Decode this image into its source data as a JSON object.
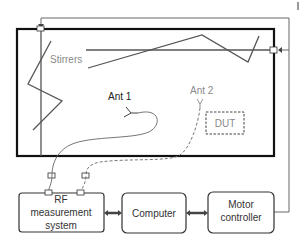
{
  "diagram": {
    "chamber_labels": {
      "stirrers": "Stirrers",
      "ant1": "Ant 1",
      "ant2": "Ant 2",
      "dut": "DUT"
    },
    "blocks": [
      {
        "id": "rf",
        "lines": [
          "RF",
          "measurement",
          "system"
        ]
      },
      {
        "id": "computer",
        "lines": [
          "Computer"
        ]
      },
      {
        "id": "motor",
        "lines": [
          "Motor",
          "controller"
        ]
      }
    ],
    "colors": {
      "chamber_wall": "#111111",
      "stirrer": "#555555",
      "cable": "#666666",
      "ant2_label": "#8a8a8a",
      "stirrer_label": "#9a9a9a",
      "dut_border": "#444444"
    },
    "corner_mark": "|"
  }
}
